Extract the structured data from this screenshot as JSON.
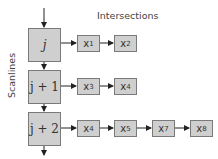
{
  "title": "Intersections",
  "axis_label": "Scanlines",
  "scanlines": [
    {
      "label": "j",
      "intersections": [
        {
          "base": "x",
          "sub": "1"
        },
        {
          "base": "x",
          "sub": "2"
        }
      ]
    },
    {
      "label": "j + 1",
      "intersections": [
        {
          "base": "x",
          "sub": "3"
        },
        {
          "base": "x",
          "sub": "4"
        }
      ]
    },
    {
      "label": "j + 2",
      "intersections": [
        {
          "base": "x",
          "sub": "4"
        },
        {
          "base": "x",
          "sub": "5"
        },
        {
          "base": "x",
          "sub": "7"
        },
        {
          "base": "x",
          "sub": "8"
        }
      ]
    }
  ],
  "colors": {
    "box_fill": "#cfcfcf",
    "box_border": "#7a7a7a",
    "arrow": "#222222"
  }
}
